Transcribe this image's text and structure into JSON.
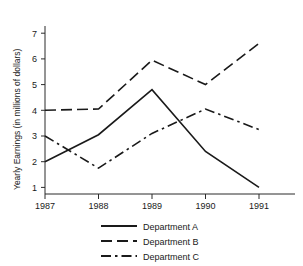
{
  "chart_data": {
    "type": "line",
    "title": "",
    "xlabel": "",
    "ylabel": "Yearly Earnings (in millions of dollars)",
    "categories": [
      "1987",
      "1988",
      "1989",
      "1990",
      "1991"
    ],
    "x": [
      1987,
      1988,
      1989,
      1990,
      1991
    ],
    "xlim": [
      1987,
      1991
    ],
    "ylim": [
      0,
      7.5
    ],
    "yticks": [
      "1",
      "2",
      "3",
      "4",
      "5",
      "6",
      "7"
    ],
    "ytick_values": [
      1,
      2,
      3,
      4,
      5,
      6,
      7
    ],
    "grid": false,
    "legend_position": "bottom",
    "series": [
      {
        "name": "Department A",
        "style": "solid",
        "values": [
          2.0,
          3.05,
          4.8,
          2.4,
          1.0
        ]
      },
      {
        "name": "Department B",
        "style": "dashed",
        "values": [
          4.0,
          4.05,
          5.95,
          5.0,
          6.6
        ]
      },
      {
        "name": "Department C",
        "style": "dash-dot",
        "values": [
          3.0,
          1.75,
          3.1,
          4.05,
          3.25
        ]
      }
    ]
  },
  "axis": {
    "y_label": "Yearly Earnings (in millions of dollars)",
    "y_ticks": [
      "7",
      "6",
      "5",
      "4",
      "3",
      "2",
      "1"
    ],
    "x_ticks": [
      "1987",
      "1988",
      "1989",
      "1990",
      "1991"
    ]
  },
  "legend": {
    "items": [
      {
        "label": "Department A",
        "style": "solid"
      },
      {
        "label": "Department B",
        "style": "dashed"
      },
      {
        "label": "Department C",
        "style": "dash-dot"
      }
    ]
  }
}
